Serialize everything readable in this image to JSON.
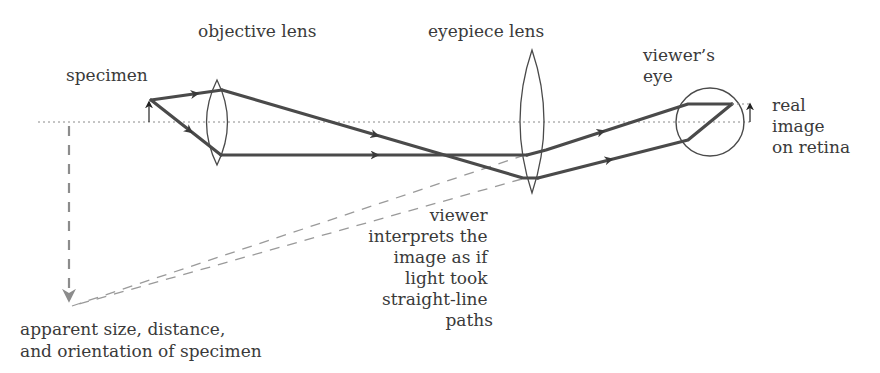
{
  "diagram": {
    "labels": {
      "specimen": "specimen",
      "objective_lens": "objective lens",
      "eyepiece_lens": "eyepiece lens",
      "viewers_eye": [
        "viewer’s",
        "eye"
      ],
      "real_image": [
        "real",
        "image",
        "on retina"
      ],
      "interpretation": [
        "viewer",
        "interprets the",
        "image as if",
        "light took",
        "straight-line",
        "paths"
      ],
      "apparent": [
        "apparent size, distance,",
        "and orientation of specimen"
      ]
    },
    "colors": {
      "ray": "#4a4a4a",
      "virtual_ray": "#9a9a9a",
      "axis": "#8a8a8a",
      "text": "#3a3a3a"
    }
  }
}
